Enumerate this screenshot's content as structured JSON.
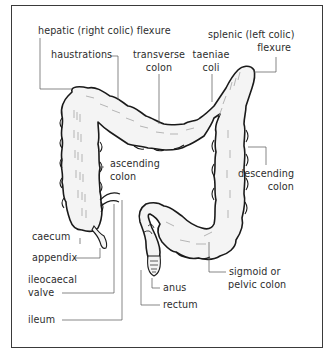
{
  "figure": {
    "labels": {
      "hepatic_flexure": "hepatic (right colic) flexure",
      "splenic_flexure_l1": "splenic (left colic)",
      "splenic_flexure_l2": "flexure",
      "haustrations": "haustrations",
      "transverse_l1": "transverse",
      "transverse_l2": "colon",
      "taeniae_l1": "taeniae",
      "taeniae_l2": "coli",
      "ascending_l1": "ascending",
      "ascending_l2": "colon",
      "descending_l1": "descending",
      "descending_l2": "colon",
      "caecum": "caecum",
      "appendix": "appendix",
      "ileocaecal_l1": "ileocaecal",
      "ileocaecal_l2": "valve",
      "ileum": "ileum",
      "anus": "anus",
      "rectum": "rectum",
      "sigmoid_l1": "sigmoid or",
      "sigmoid_l2": "pelvic colon"
    },
    "colors": {
      "outline": "#1a1a1a",
      "leader": "#555555",
      "fill": "#f4f4f4",
      "shading": "#9a9a9a",
      "text": "#2d2d2d"
    }
  }
}
